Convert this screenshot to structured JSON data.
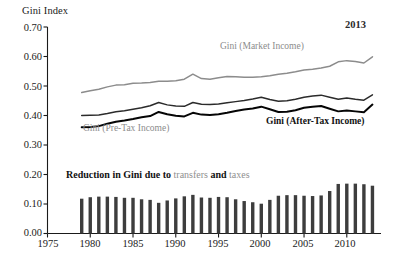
{
  "chart_data": {
    "type": "line",
    "title": "",
    "ylabel": "Gini Index",
    "xlabel": "",
    "ylim": [
      0.0,
      0.7
    ],
    "xlim": [
      1975,
      2014
    ],
    "grid": false,
    "legend_position": "inline-annotations",
    "y_ticks": [
      "0.00",
      "0.10",
      "0.20",
      "0.30",
      "0.40",
      "0.50",
      "0.60",
      "0.70"
    ],
    "y_tick_values": [
      0.0,
      0.1,
      0.2,
      0.3,
      0.4,
      0.5,
      0.6,
      0.7
    ],
    "x_ticks": [
      "1975",
      "1980",
      "1985",
      "1990",
      "1995",
      "2000",
      "2005",
      "2010"
    ],
    "x_tick_values": [
      1975,
      1980,
      1985,
      1990,
      1995,
      2000,
      2005,
      2010
    ],
    "x": [
      1979,
      1980,
      1981,
      1982,
      1983,
      1984,
      1985,
      1986,
      1987,
      1988,
      1989,
      1990,
      1991,
      1992,
      1993,
      1994,
      1995,
      1996,
      1997,
      1998,
      1999,
      2000,
      2001,
      2002,
      2003,
      2004,
      2005,
      2006,
      2007,
      2008,
      2009,
      2010,
      2011,
      2012,
      2013
    ],
    "series": [
      {
        "name": "Gini (Market Income)",
        "color": "#8c8c8c",
        "values": [
          0.478,
          0.484,
          0.489,
          0.497,
          0.503,
          0.504,
          0.509,
          0.51,
          0.512,
          0.516,
          0.516,
          0.518,
          0.523,
          0.54,
          0.525,
          0.523,
          0.528,
          0.532,
          0.531,
          0.53,
          0.53,
          0.531,
          0.535,
          0.54,
          0.543,
          0.548,
          0.554,
          0.557,
          0.561,
          0.567,
          0.582,
          0.586,
          0.583,
          0.578,
          0.599
        ]
      },
      {
        "name": "Gini (Pre-Tax Income)",
        "color": "#2b2b2b",
        "values": [
          0.4,
          0.401,
          0.402,
          0.407,
          0.413,
          0.416,
          0.421,
          0.426,
          0.433,
          0.444,
          0.436,
          0.432,
          0.431,
          0.444,
          0.438,
          0.437,
          0.439,
          0.443,
          0.447,
          0.451,
          0.456,
          0.462,
          0.454,
          0.448,
          0.45,
          0.455,
          0.462,
          0.466,
          0.469,
          0.462,
          0.455,
          0.459,
          0.455,
          0.452,
          0.47
        ]
      },
      {
        "name": "Gini (After-Tax Income)",
        "color": "#050505",
        "values": [
          0.36,
          0.361,
          0.364,
          0.372,
          0.379,
          0.383,
          0.388,
          0.394,
          0.398,
          0.412,
          0.404,
          0.399,
          0.397,
          0.409,
          0.403,
          0.402,
          0.404,
          0.409,
          0.415,
          0.42,
          0.424,
          0.43,
          0.421,
          0.412,
          0.413,
          0.418,
          0.426,
          0.43,
          0.432,
          0.423,
          0.414,
          0.417,
          0.414,
          0.411,
          0.437
        ]
      }
    ],
    "bars": {
      "name": "Reduction in Gini due to transfers and taxes",
      "color": "#3d3d3d",
      "values": [
        0.118,
        0.123,
        0.125,
        0.125,
        0.124,
        0.121,
        0.121,
        0.116,
        0.114,
        0.104,
        0.112,
        0.119,
        0.126,
        0.131,
        0.122,
        0.121,
        0.124,
        0.123,
        0.116,
        0.11,
        0.106,
        0.101,
        0.114,
        0.128,
        0.13,
        0.13,
        0.128,
        0.127,
        0.129,
        0.144,
        0.168,
        0.169,
        0.169,
        0.167,
        0.162
      ]
    },
    "annotations": [
      {
        "id": "year-note",
        "text": "2013"
      },
      {
        "id": "market-label",
        "text": "Gini (Market Income)"
      },
      {
        "id": "pretax-label",
        "text": "Gini (Pre-Tax Income)"
      },
      {
        "id": "aftertax-label",
        "text": "Gini (After-Tax Income)"
      }
    ]
  },
  "labels": {
    "y_axis_title": "Gini Index",
    "year_note": "2013",
    "market_label": "Gini (Market Income)",
    "pretax_label": "Gini (Pre-Tax Income)",
    "aftertax_label": "Gini (After-Tax Income)",
    "bars_caption_part1": "Reduction in Gini due to ",
    "bars_caption_transfers": "transfers",
    "bars_caption_and": " and ",
    "bars_caption_taxes": "taxes"
  },
  "y_tick_labels": {
    "t0": "0.00",
    "t1": "0.10",
    "t2": "0.20",
    "t3": "0.30",
    "t4": "0.40",
    "t5": "0.50",
    "t6": "0.60",
    "t7": "0.70"
  },
  "x_tick_labels": {
    "t0": "1975",
    "t1": "1980",
    "t2": "1985",
    "t3": "1990",
    "t4": "1995",
    "t5": "2000",
    "t6": "2005",
    "t7": "2010"
  },
  "colors": {
    "market": "#8c8c8c",
    "pretax": "#2b2b2b",
    "aftertax": "#050505",
    "bars": "#3d3d3d",
    "axis": "#1a1a1a",
    "background": "#ffffff"
  }
}
